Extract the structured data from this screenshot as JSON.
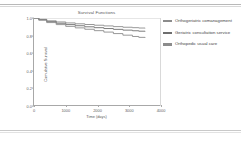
{
  "figure": {
    "title": "Survival Functions",
    "xlabel": "Time (days)",
    "ylabel": "Cumulative Survival"
  },
  "axes": {
    "xticks": [
      "0",
      "1000",
      "2000",
      "3000",
      "4000"
    ],
    "yticks": [
      "1.0",
      "0.8",
      "0.6",
      "0.4",
      "0.2",
      "0.0"
    ]
  },
  "legend": {
    "items": [
      {
        "label": "Orthogeriatric comanagement",
        "color": "#8c8c8c",
        "swatch": "legend-swatch-line"
      },
      {
        "label": "Geriatric consultation service",
        "color": "#6e6e6e",
        "swatch": "legend-swatch-line"
      },
      {
        "label": "Orthopedic usual care",
        "color": "#8c8c8c",
        "swatch": "legend-swatch-line"
      }
    ]
  },
  "chart_data": {
    "type": "line",
    "title": "Survival Functions",
    "xlabel": "Time (days)",
    "ylabel": "Cumulative Survival",
    "xlim": [
      0,
      4000
    ],
    "ylim": [
      0.0,
      1.0
    ],
    "xticks": [
      0,
      1000,
      2000,
      3000,
      4000
    ],
    "yticks": [
      0.0,
      0.2,
      0.4,
      0.6,
      0.8,
      1.0
    ],
    "grid": false,
    "legend_position": "right",
    "series": [
      {
        "name": "Orthogeriatric comanagement",
        "color": "#8c8c8c",
        "x": [
          0,
          150,
          400,
          700,
          1000,
          1300,
          1600,
          1900,
          2200,
          2500,
          2800,
          3100,
          3300,
          3500
        ],
        "y": [
          1.0,
          0.985,
          0.968,
          0.955,
          0.944,
          0.934,
          0.926,
          0.918,
          0.91,
          0.902,
          0.895,
          0.89,
          0.886,
          0.884
        ]
      },
      {
        "name": "Geriatric consultation service",
        "color": "#6e6e6e",
        "x": [
          0,
          150,
          400,
          700,
          1000,
          1300,
          1600,
          1900,
          2200,
          2500,
          2800,
          3100,
          3300,
          3500
        ],
        "y": [
          1.0,
          0.98,
          0.958,
          0.94,
          0.925,
          0.912,
          0.9,
          0.89,
          0.88,
          0.871,
          0.862,
          0.855,
          0.85,
          0.847
        ]
      },
      {
        "name": "Orthopedic usual care",
        "color": "#8c8c8c",
        "x": [
          0,
          150,
          400,
          700,
          1000,
          1300,
          1600,
          1900,
          2200,
          2500,
          2800,
          3100,
          3300,
          3500
        ],
        "y": [
          1.0,
          0.975,
          0.948,
          0.925,
          0.905,
          0.888,
          0.872,
          0.856,
          0.84,
          0.823,
          0.805,
          0.79,
          0.78,
          0.775
        ]
      }
    ]
  }
}
